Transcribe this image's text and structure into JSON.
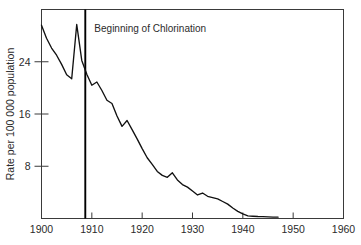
{
  "chart_data": {
    "type": "line",
    "title": "",
    "xlabel": "",
    "ylabel": "Rate per 100 000 population",
    "xlim": [
      1900,
      1960
    ],
    "ylim": [
      0,
      32
    ],
    "grid": false,
    "legend": null,
    "xticks": [
      1900,
      1910,
      1920,
      1930,
      1940,
      1950,
      1960
    ],
    "xtick_labels": [
      "1900",
      "1910",
      "1920",
      "1930",
      "1940",
      "1950",
      "1960"
    ],
    "yticks": [
      8,
      16,
      24
    ],
    "ytick_labels": [
      "8",
      "16",
      "24"
    ],
    "annotations": [
      {
        "text": "Beginning of Chlorination",
        "type": "vertical-line-with-label",
        "x": 1908.7,
        "label_x": 1910.5,
        "label_y": 28.5
      }
    ],
    "series": [
      {
        "name": "Typhoid fever death rate",
        "x": [
          1900,
          1901,
          1902,
          1903,
          1904,
          1905,
          1906,
          1907,
          1908,
          1909,
          1910,
          1911,
          1912,
          1913,
          1914,
          1915,
          1916,
          1917,
          1918,
          1919,
          1920,
          1921,
          1922,
          1923,
          1924,
          1925,
          1926,
          1927,
          1928,
          1929,
          1930,
          1931,
          1932,
          1933,
          1934,
          1935,
          1936,
          1937,
          1938,
          1939,
          1940,
          1941,
          1942,
          1943,
          1944,
          1945,
          1946,
          1947
        ],
        "values": [
          29.6,
          27.6,
          26.1,
          25.0,
          23.6,
          22.0,
          21.4,
          29.7,
          24.2,
          22.1,
          20.4,
          20.9,
          19.6,
          18.1,
          17.6,
          15.7,
          14.1,
          15.0,
          13.6,
          12.2,
          10.7,
          9.3,
          8.3,
          7.2,
          6.6,
          6.3,
          7.0,
          5.9,
          5.2,
          4.8,
          4.2,
          3.6,
          3.9,
          3.4,
          3.2,
          3.0,
          2.6,
          2.2,
          1.6,
          1.1,
          0.7,
          0.4,
          0.35,
          0.3,
          0.28,
          0.25,
          0.22,
          0.2
        ]
      }
    ]
  },
  "axes": {
    "ylabel_text": "Rate per 100 000 population"
  }
}
